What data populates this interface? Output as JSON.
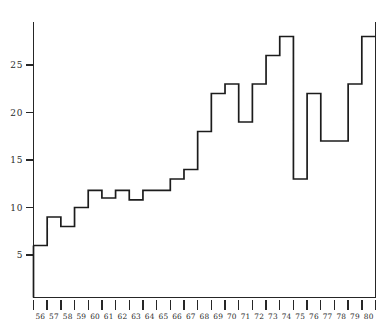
{
  "chart_data": {
    "type": "bar",
    "title": "",
    "subtitle": "",
    "xlabel": "",
    "ylabel": "",
    "style": "step-histogram",
    "grid": false,
    "legend": false,
    "categories": [
      "56",
      "57",
      "58",
      "59",
      "60",
      "61",
      "62",
      "63",
      "64",
      "65",
      "66",
      "67",
      "68",
      "69",
      "70",
      "71",
      "72",
      "73",
      "74",
      "75",
      "76",
      "77",
      "78",
      "79",
      "80"
    ],
    "values": [
      6,
      9,
      8,
      10,
      11.8,
      11,
      11.8,
      10.8,
      11.8,
      11.8,
      13,
      14,
      18,
      22,
      23,
      19,
      23,
      26,
      28,
      13,
      22,
      17,
      17,
      23,
      28
    ],
    "xlim": [
      55.5,
      80.5
    ],
    "ylim": [
      0,
      29.5
    ],
    "yticks": [
      5,
      10,
      15,
      20,
      25
    ],
    "ytick_labels": [
      "5",
      "10",
      "15",
      "20",
      "25"
    ],
    "xtick_labels": [
      "56",
      "57",
      "58",
      "59",
      "60",
      "61",
      "62",
      "63",
      "64",
      "65",
      "66",
      "67",
      "68",
      "69",
      "70",
      "71",
      "72",
      "73",
      "74",
      "75",
      "76",
      "77",
      "78",
      "79",
      "80"
    ],
    "line_color": "#1c1c1c",
    "axis_color": "#262626",
    "background_color": "#ffffff",
    "annotations": []
  },
  "figure": {
    "name": "step-line-chart"
  }
}
